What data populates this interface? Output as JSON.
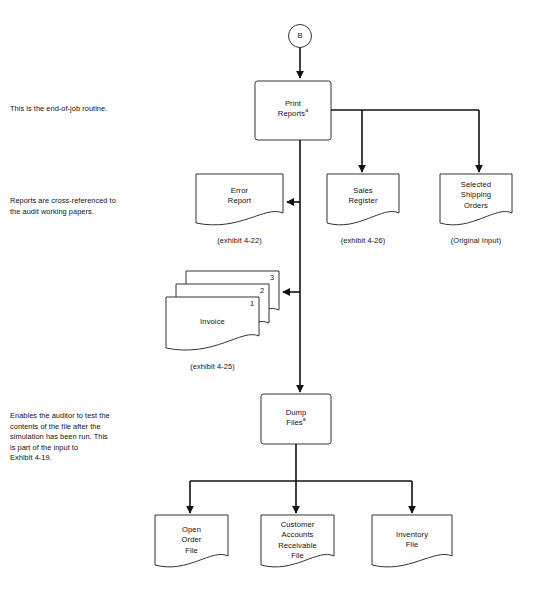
{
  "diagram": {
    "connector": {
      "label": "B",
      "name": "connector-b"
    },
    "annotations": [
      {
        "id": "ann-end-of-job",
        "text": "This is the end-of-job routine."
      },
      {
        "id": "ann-cross-reference",
        "text": "Reports are cross-referenced to\nthe audit working papers."
      },
      {
        "id": "ann-dump-files",
        "text": "Enables the auditor to test the\ncontents of the file after the\nsimulation has been run.  This\nis part of the input to\nExhibit 4-19."
      }
    ],
    "processes": [
      {
        "id": "print-reports",
        "label": "Print\nReports",
        "footnote": "a"
      },
      {
        "id": "dump-files",
        "label": "Dump\nFiles",
        "footnote": "a"
      }
    ],
    "documents": [
      {
        "id": "error-report",
        "label": "Error\nReport",
        "caption": "(exhibit 4-22)"
      },
      {
        "id": "sales-register",
        "label": "Sales\nRegister",
        "caption": "(exhibit 4-26)"
      },
      {
        "id": "selected-shipping-orders",
        "label": "Selected\nShipping\nOrders",
        "caption": "(Original Input)"
      },
      {
        "id": "invoice",
        "label": "Invoice",
        "caption": "(exhibit 4-25)",
        "stack_numbers": [
          "1",
          "2",
          "3"
        ]
      }
    ],
    "files": [
      {
        "id": "open-order-file",
        "label": "Open\nOrder\nFile"
      },
      {
        "id": "customer-accounts-receivable-file",
        "label": "Customer\nAccounts\nReceivable\nFile"
      },
      {
        "id": "inventory-file",
        "label": "Inventory\nFile"
      }
    ],
    "colors": {
      "line": "#111111",
      "shape_stroke": "#333333",
      "background": "#ffffff",
      "text": "#111111"
    }
  }
}
